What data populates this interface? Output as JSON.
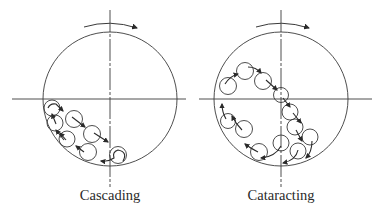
{
  "diagram": {
    "stroke_color": "#3a3a3a",
    "panels": [
      {
        "label": "Cascading",
        "drum": {
          "cx": 110,
          "cy": 99,
          "r": 68
        },
        "rotation": "clockwise",
        "balls": [
          {
            "cx": 52,
            "cy": 108
          },
          {
            "cx": 74,
            "cy": 119
          },
          {
            "cx": 92,
            "cy": 134
          },
          {
            "cx": 55,
            "cy": 123
          },
          {
            "cx": 67,
            "cy": 139
          },
          {
            "cx": 88,
            "cy": 152
          },
          {
            "cx": 118,
            "cy": 155
          }
        ]
      },
      {
        "label": "Cataracting",
        "drum": {
          "cx": 281,
          "cy": 99,
          "r": 68
        },
        "rotation": "clockwise",
        "balls": [
          {
            "cx": 228,
            "cy": 86
          },
          {
            "cx": 245,
            "cy": 71
          },
          {
            "cx": 263,
            "cy": 81
          },
          {
            "cx": 281,
            "cy": 95
          },
          {
            "cx": 290,
            "cy": 112
          },
          {
            "cx": 295,
            "cy": 127
          },
          {
            "cx": 310,
            "cy": 137
          },
          {
            "cx": 298,
            "cy": 151
          },
          {
            "cx": 281,
            "cy": 143
          },
          {
            "cx": 259,
            "cy": 152
          },
          {
            "cx": 244,
            "cy": 129
          },
          {
            "cx": 228,
            "cy": 121
          }
        ]
      }
    ]
  }
}
